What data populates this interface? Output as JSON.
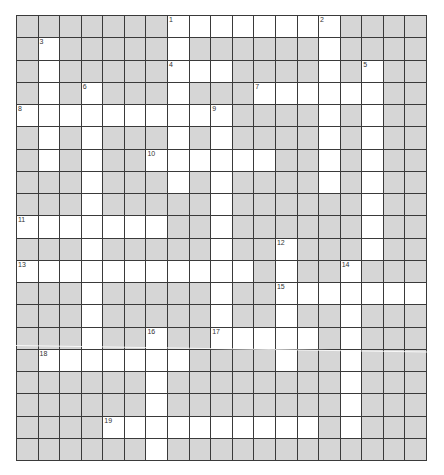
{
  "puzzle": {
    "cols": 19,
    "rows": 20,
    "colors": {
      "block": "#d6d6d6",
      "open": "#ffffff",
      "line": "#3a3a3a"
    },
    "layout": [
      "GGGGGGGWWWWWWWWGGGG",
      "GWGGGGGWGGGGGGWGGGG",
      "GWGGGGGWWWGGGGWGWGG",
      "GWGWGGGWGGGWWWWWWGG",
      "WWWWWWWWWWGGGGWGWGG",
      "GWGWGGGWGWGGGGWGWGG",
      "GWGWGGWWWWWWGGWGWGG",
      "GGGWGGGWGWGGGGWGWGG",
      "GGGWGGGGGWGGGGGGWGG",
      "WWWWWWWGGWGGGGGGWGG",
      "GGGWGGGGGWGGWGGGWGG",
      "WWWWWWWWWWWGWGGWGGG",
      "GGGWGGGGGWGGWWWWWWW",
      "GGGWGGGGGWGGWGGWGGG",
      "GGGWGGWGGWWWWWGWGGG",
      "GWWWWWWWGGGGWGGWGGG",
      "GGGGGGWGGGGGGGGWGGG",
      "GGGGGGWGGGGGGGGWGGG",
      "GGGGWWWWWWWWWWGWGGG",
      "GGGGGGWGGGGGGGGGGGG"
    ],
    "numbers": [
      {
        "n": "1",
        "r": 0,
        "c": 7
      },
      {
        "n": "2",
        "r": 0,
        "c": 14
      },
      {
        "n": "3",
        "r": 1,
        "c": 1
      },
      {
        "n": "4",
        "r": 2,
        "c": 7
      },
      {
        "n": "5",
        "r": 2,
        "c": 16
      },
      {
        "n": "6",
        "r": 3,
        "c": 3
      },
      {
        "n": "7",
        "r": 3,
        "c": 11
      },
      {
        "n": "8",
        "r": 4,
        "c": 0
      },
      {
        "n": "9",
        "r": 4,
        "c": 9
      },
      {
        "n": "10",
        "r": 6,
        "c": 6
      },
      {
        "n": "11",
        "r": 9,
        "c": 0
      },
      {
        "n": "12",
        "r": 10,
        "c": 12
      },
      {
        "n": "13",
        "r": 11,
        "c": 0
      },
      {
        "n": "14",
        "r": 11,
        "c": 15
      },
      {
        "n": "15",
        "r": 12,
        "c": 12
      },
      {
        "n": "16",
        "r": 14,
        "c": 6
      },
      {
        "n": "17",
        "r": 14,
        "c": 9
      },
      {
        "n": "18",
        "r": 15,
        "c": 1
      },
      {
        "n": "19",
        "r": 18,
        "c": 4
      }
    ]
  }
}
